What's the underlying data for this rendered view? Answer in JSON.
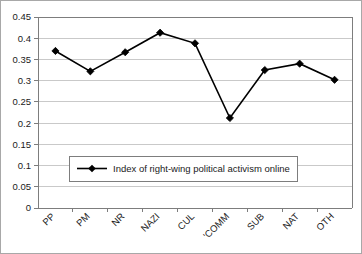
{
  "chart_data": {
    "type": "line",
    "title": "",
    "xlabel": "",
    "ylabel": "",
    "categories": [
      "PP",
      "PM",
      "NR",
      "NAZI",
      "CUL",
      "'COMM",
      "SUB",
      "NAT",
      "OTH"
    ],
    "series": [
      {
        "name": "Index of right-wing political activism online",
        "values": [
          0.37,
          0.322,
          0.367,
          0.413,
          0.388,
          0.212,
          0.325,
          0.34,
          0.302
        ],
        "marker": "diamond",
        "color": "#000000"
      }
    ],
    "ylim": [
      0,
      0.45
    ],
    "yticks": [
      0,
      0.05,
      0.1,
      0.15,
      0.2,
      0.25,
      0.3,
      0.35,
      0.4,
      0.45
    ],
    "ytick_labels": [
      "0",
      "0.05",
      "0.1",
      "0.15",
      "0.2",
      "0.25",
      "0.3",
      "0.35",
      "0.4",
      "0.45"
    ],
    "grid": {
      "horizontal": true,
      "vertical": false,
      "color": "#c9c9c9"
    },
    "legend": {
      "position": "inside-lower-left",
      "entries": [
        "Index of right-wing political activism online"
      ],
      "border_color": "#7d7d7d",
      "background": "#ffffff"
    },
    "axis": {
      "color": "#7d7d7d",
      "xtick_rotation_deg": 45
    },
    "plot_background": "#ffffff",
    "frame_border_color": "#a8a8a8"
  }
}
